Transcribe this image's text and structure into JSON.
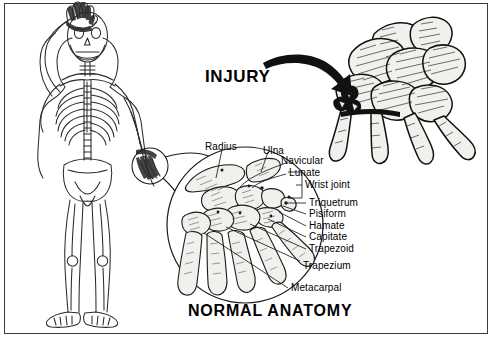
{
  "figure": {
    "border_color": "#3b3b3b",
    "background": "#ffffff",
    "ink_color": "#000000",
    "width": 493,
    "height": 340
  },
  "headings": {
    "injury_title": "INJURY",
    "normal_anatomy_title": "NORMAL ANATOMY"
  },
  "labels": {
    "radius": "Radius",
    "ulna": "Ulna",
    "navicular": "Navicular",
    "lunate": "Lunate",
    "wrist_joint": "Wrist joint",
    "triquetrum": "Triquetrum",
    "pisiform": "Pisiform",
    "hamate": "Hamate",
    "capitate": "Capitate",
    "trapezoid": "Trapezoid",
    "trapezium": "Trapezium",
    "metacarpal": "Metacarpal"
  },
  "panels": {
    "skeleton_figure": "full-body-skeleton",
    "magnified_wrist": "normal-wrist-anatomy-detail",
    "injured_wrist": "injured-wrist-detail",
    "callout_circle": "hand-magnifier-callout",
    "injury_arrow": "curved-arrow-icon"
  }
}
